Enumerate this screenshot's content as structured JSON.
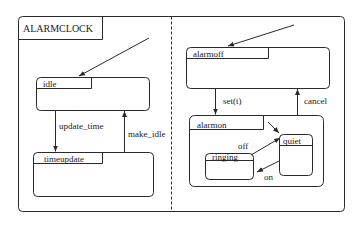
{
  "diagram": {
    "type": "statechart",
    "title": "ALARMCLOCK",
    "regions": [
      {
        "name": "left-region",
        "initial_state": "idle",
        "states": [
          {
            "id": "idle",
            "label": "idle"
          },
          {
            "id": "timeupdate",
            "label": "timeupdate"
          }
        ],
        "transitions": [
          {
            "from": "idle",
            "to": "timeupdate",
            "label": "update_time"
          },
          {
            "from": "timeupdate",
            "to": "idle",
            "label": "make_idle"
          }
        ]
      },
      {
        "name": "right-region",
        "initial_state": "alarmoff",
        "states": [
          {
            "id": "alarmoff",
            "label": "alarmoff"
          },
          {
            "id": "alarmon",
            "label": "alarmon",
            "initial_state": "quiet",
            "substates": [
              {
                "id": "ringing",
                "label": "ringing"
              },
              {
                "id": "quiet",
                "label": "quiet"
              }
            ],
            "transitions": [
              {
                "from": "ringing",
                "to": "quiet",
                "label": "off"
              },
              {
                "from": "quiet",
                "to": "ringing",
                "label": "on"
              }
            ]
          }
        ],
        "transitions": [
          {
            "from": "alarmoff",
            "to": "alarmon",
            "label": "set(t)"
          },
          {
            "from": "alarmon",
            "to": "alarmoff",
            "label": "cancel"
          }
        ]
      }
    ]
  },
  "labels": {
    "title": "ALARMCLOCK",
    "idle": "idle",
    "timeupdate": "timeupdate",
    "update_time": "update_time",
    "make_idle": "make_idle",
    "alarmoff": "alarmoff",
    "alarmon": "alarmon",
    "set_t": "set(t)",
    "cancel": "cancel",
    "ringing": "ringing",
    "quiet": "quiet",
    "off": "off",
    "on": "on"
  },
  "colors": {
    "line": "#2a2a2a",
    "background": "#ffffff"
  }
}
